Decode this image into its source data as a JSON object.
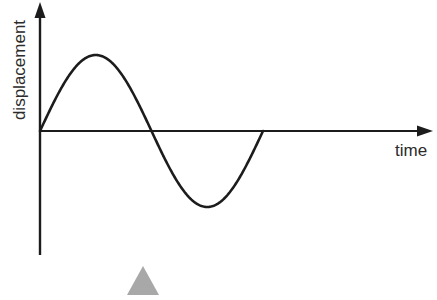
{
  "figure": {
    "background_color": "#ffffff",
    "stroke_color": "#1c1c1c",
    "marker_color": "#a8a8a8"
  },
  "axes": {
    "y_label": "displacement",
    "x_label": "time"
  },
  "marker": {
    "name": "triangle-marker",
    "shape": "triangle",
    "color": "#a8a8a8"
  },
  "chart_data": {
    "type": "line",
    "title": "",
    "subtitle": "",
    "xlabel": "time",
    "ylabel": "displacement",
    "grid": false,
    "legend": null,
    "annotations": [
      {
        "name": "triangle-marker",
        "text": "",
        "shape": "triangle",
        "color": "#a8a8a8"
      }
    ],
    "axis_style": {
      "x_axis": "arrow-right",
      "y_axis": "arrow-up",
      "ticks": false,
      "tick_labels": false
    },
    "xlim": [
      0,
      4
    ],
    "ylim": [
      -1.3,
      1.6
    ],
    "series": [
      {
        "name": "displacement-wave",
        "type": "sine",
        "amplitude": 1,
        "periods": 1,
        "phase": 0,
        "x": [
          0.0,
          0.05,
          0.1,
          0.15,
          0.2,
          0.25,
          0.3,
          0.35,
          0.4,
          0.45,
          0.5,
          0.55,
          0.6,
          0.65,
          0.7,
          0.75,
          0.8,
          0.85,
          0.9,
          0.95,
          1.0
        ],
        "values": [
          0.0,
          0.309,
          0.588,
          0.809,
          0.951,
          1.0,
          0.951,
          0.809,
          0.588,
          0.309,
          0.0,
          -0.309,
          -0.588,
          -0.809,
          -0.951,
          -1.0,
          -0.951,
          -0.809,
          -0.588,
          -0.309,
          0.0
        ]
      }
    ]
  }
}
